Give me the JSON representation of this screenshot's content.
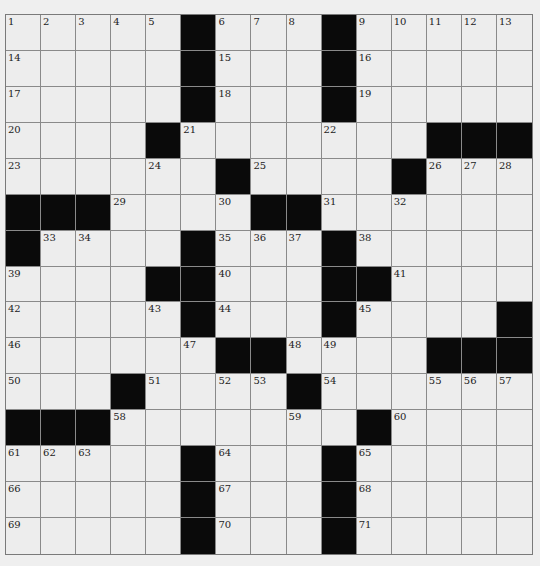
{
  "puzzle": {
    "rows": 15,
    "cols": 15,
    "colors": {
      "background": "#efefef",
      "cell": "#ededed",
      "block": "#0a0a0a",
      "gridline": "#8a8a8a"
    },
    "layout": [
      ".....#...#.....",
      ".....#...#.....",
      ".....#...#.....",
      "....#.......###",
      "......#....#...",
      "###....##......",
      "#....#...#.....",
      "....##...##....",
      ".....#...#....#",
      "......##....###",
      "...#....#......",
      "###.......#....",
      ".....#...#.....",
      ".....#...#.....",
      ".....#...#....."
    ],
    "numbers": [
      [
        1,
        2,
        3,
        4,
        5,
        0,
        6,
        7,
        8,
        0,
        9,
        10,
        11,
        12,
        13
      ],
      [
        14,
        0,
        0,
        0,
        0,
        0,
        15,
        0,
        0,
        0,
        16,
        0,
        0,
        0,
        0
      ],
      [
        17,
        0,
        0,
        0,
        0,
        0,
        18,
        0,
        0,
        0,
        19,
        0,
        0,
        0,
        0
      ],
      [
        20,
        0,
        0,
        0,
        0,
        21,
        0,
        0,
        0,
        22,
        0,
        0,
        0,
        0,
        0
      ],
      [
        23,
        0,
        0,
        0,
        24,
        0,
        0,
        25,
        0,
        0,
        0,
        0,
        26,
        27,
        28
      ],
      [
        0,
        0,
        0,
        29,
        0,
        0,
        30,
        0,
        0,
        31,
        0,
        32,
        0,
        0,
        0
      ],
      [
        0,
        33,
        34,
        0,
        0,
        0,
        35,
        36,
        37,
        0,
        38,
        0,
        0,
        0,
        0
      ],
      [
        39,
        0,
        0,
        0,
        0,
        0,
        40,
        0,
        0,
        0,
        0,
        41,
        0,
        0,
        0
      ],
      [
        42,
        0,
        0,
        0,
        43,
        0,
        44,
        0,
        0,
        0,
        45,
        0,
        0,
        0,
        0
      ],
      [
        46,
        0,
        0,
        0,
        0,
        47,
        0,
        0,
        48,
        49,
        0,
        0,
        0,
        0,
        0
      ],
      [
        50,
        0,
        0,
        0,
        51,
        0,
        52,
        53,
        0,
        54,
        0,
        0,
        55,
        56,
        57
      ],
      [
        0,
        0,
        0,
        58,
        0,
        0,
        0,
        0,
        59,
        0,
        0,
        60,
        0,
        0,
        0
      ],
      [
        61,
        62,
        63,
        0,
        0,
        0,
        64,
        0,
        0,
        0,
        65,
        0,
        0,
        0,
        0
      ],
      [
        66,
        0,
        0,
        0,
        0,
        0,
        67,
        0,
        0,
        0,
        68,
        0,
        0,
        0,
        0
      ],
      [
        69,
        0,
        0,
        0,
        0,
        0,
        70,
        0,
        0,
        0,
        71,
        0,
        0,
        0,
        0
      ]
    ],
    "letters": []
  }
}
